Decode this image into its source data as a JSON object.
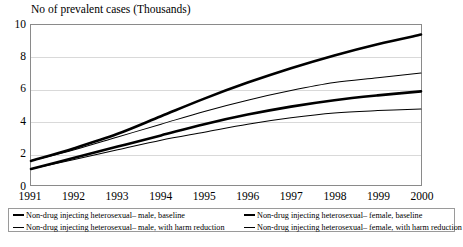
{
  "chart_data": {
    "type": "line",
    "title": "No of prevalent cases (Thousands)",
    "xlabel": "",
    "ylabel": "",
    "x": [
      1991,
      1992,
      1993,
      1994,
      1995,
      1996,
      1997,
      1998,
      1999,
      2000
    ],
    "categories": [
      "1991",
      "1992",
      "1993",
      "1994",
      "1995",
      "1996",
      "1997",
      "1998",
      "1999",
      "2000"
    ],
    "xlim": [
      1991,
      2000
    ],
    "ylim": [
      0,
      10
    ],
    "yticks": [
      0,
      2,
      4,
      6,
      8,
      10
    ],
    "ytick_labels": [
      "0",
      "2",
      "4",
      "6",
      "8",
      "10"
    ],
    "grid": true,
    "legend_position": "bottom",
    "series": [
      {
        "name": "Non-drug injecting heterosexual– male, baseline",
        "style": "thick",
        "color": "#000000",
        "values": [
          1.5,
          2.3,
          3.2,
          4.3,
          5.4,
          6.4,
          7.3,
          8.1,
          8.8,
          9.4
        ]
      },
      {
        "name": "Non-drug injecting heterosexual– female, baseline",
        "style": "thin",
        "color": "#000000",
        "values": [
          1.5,
          2.2,
          3.0,
          3.8,
          4.6,
          5.3,
          5.9,
          6.4,
          6.7,
          7.0
        ]
      },
      {
        "name": "Non-drug injecting heterosexual– male, with harm reduction",
        "style": "thick",
        "color": "#000000",
        "values": [
          1.0,
          1.7,
          2.4,
          3.1,
          3.8,
          4.4,
          4.9,
          5.3,
          5.6,
          5.85
        ]
      },
      {
        "name": "Non-drug injecting heterosexual– female, with harm reduction",
        "style": "thin",
        "color": "#000000",
        "values": [
          1.0,
          1.6,
          2.2,
          2.8,
          3.3,
          3.8,
          4.2,
          4.5,
          4.65,
          4.75
        ]
      }
    ]
  },
  "legend": {
    "items": [
      {
        "label": "Non-drug injecting heterosexual– male, baseline",
        "style": "thick"
      },
      {
        "label": "Non-drug injecting heterosexual– female, baseline",
        "style": "thick"
      },
      {
        "label": "Non-drug injecting heterosexual– male, with harm reduction",
        "style": "thin"
      },
      {
        "label": "Non-drug injecting heterosexual– female, with harm reduction",
        "style": "thin"
      }
    ]
  }
}
